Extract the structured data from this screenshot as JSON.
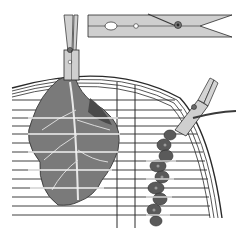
{
  "illustration": {
    "subject": "Birdcage with cabbage leaf and millet spray held by clothespins",
    "elements": [
      {
        "name": "clothespin-detail",
        "description": "Horizontal wooden spring clothespin shown separately at top"
      },
      {
        "name": "clothespin-left",
        "description": "Vertical clothespin clipping a leaf to the cage top"
      },
      {
        "name": "clothespin-right",
        "description": "Diagonal clothespin clipping a millet spray to the cage side"
      },
      {
        "name": "cabbage-leaf",
        "description": "Large leaf hanging inside cage"
      },
      {
        "name": "millet-spray",
        "description": "Seed spray hanging inside cage"
      },
      {
        "name": "birdcage",
        "description": "Domed wire cage with horizontal bars"
      }
    ],
    "colors": {
      "background": "#ffffff",
      "ink": "#2a2a2a",
      "wood": "#c9c9c9",
      "leaf": "#7a7a7a",
      "leaf_dark": "#4a4a4a",
      "millet": "#5a5a5a"
    }
  }
}
